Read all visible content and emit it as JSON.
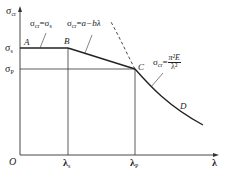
{
  "diagram": {
    "type": "critical-stress-vs-slenderness",
    "axes": {
      "y_label": "σcr",
      "y_label_main": "σ",
      "y_label_sub": "cr",
      "x_label": "λ",
      "origin_label": "O"
    },
    "y_ticks": [
      {
        "main": "σ",
        "sub": "s"
      },
      {
        "main": "σ",
        "sub": "P"
      }
    ],
    "x_ticks": [
      {
        "main": "λ",
        "sub": "s"
      },
      {
        "main": "λ",
        "sub": "P"
      }
    ],
    "points": {
      "A": "A",
      "B": "B",
      "C": "C",
      "D": "D"
    },
    "formulas": {
      "yield": {
        "lhs_main": "σ",
        "lhs_sub": "cr",
        "eq": "=",
        "rhs_main": "σ",
        "rhs_sub": "s"
      },
      "linear": {
        "lhs_main": "σ",
        "lhs_sub": "cr",
        "eq": "=",
        "rhs": "a−bλ"
      },
      "euler": {
        "lhs_main": "σ",
        "lhs_sub": "cr",
        "eq": "=",
        "numerator": "π²E",
        "denominator": "λ²"
      }
    },
    "colors": {
      "line": "#222222",
      "background": "#ffffff"
    }
  }
}
